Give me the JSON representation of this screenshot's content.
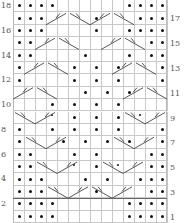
{
  "chart": {
    "cols": 14,
    "rows": 18,
    "legend_symbols": {
      "p": "purl (dot)",
      "s": "small dot",
      "": "knit (blank)",
      "R": "right cross cable",
      "L": "left cross cable"
    },
    "row_labels_left": [
      "18",
      "16",
      "14",
      "12",
      "10",
      "8",
      "6",
      "4",
      "2"
    ],
    "row_labels_right": [
      "17",
      "15",
      "13",
      "11",
      "9",
      "7",
      "5",
      "3",
      "1"
    ],
    "grid_top_to_bottom": [
      [
        "p",
        "p",
        "p",
        "p",
        "",
        "",
        "",
        "",
        "",
        "",
        "p",
        "p",
        "p",
        "p"
      ],
      [
        "p",
        "p",
        "p",
        "R",
        "R",
        "",
        "L",
        "p",
        "R",
        "",
        "L",
        "p",
        "p",
        "p"
      ],
      [
        "p",
        "p",
        "p",
        "",
        "",
        "",
        "",
        "p",
        "",
        "",
        "p",
        "p",
        "p",
        "p"
      ],
      [
        "p",
        "p",
        "R",
        "R",
        "",
        "L",
        "L",
        "",
        "",
        "R",
        "R",
        "",
        "p",
        "p"
      ],
      [
        "p",
        "p",
        "",
        "",
        "",
        "",
        "p",
        "",
        "",
        "",
        "p",
        "",
        "p",
        "p"
      ],
      [
        "p",
        "R",
        "R",
        "",
        "L",
        "p",
        "",
        "p",
        "",
        "p",
        "R",
        "",
        "L",
        "p"
      ],
      [
        "p",
        "",
        "",
        "L",
        "",
        "p",
        "",
        "p",
        "",
        "p",
        "",
        "R",
        "",
        "p"
      ],
      [
        "R",
        "",
        "L",
        "",
        "",
        "",
        "p",
        "",
        "p",
        "",
        "p",
        "",
        "",
        "L"
      ],
      [
        "",
        "",
        "",
        "p",
        "",
        "p",
        "",
        "p",
        "",
        "p",
        "",
        "",
        "",
        ""
      ],
      [
        "L",
        "",
        "R",
        "s",
        "",
        "p",
        "",
        "p",
        "",
        "p",
        "",
        "s",
        "",
        "R"
      ],
      [
        "p",
        "",
        "",
        "p",
        "",
        "p",
        "",
        "p",
        "",
        "p",
        "",
        "",
        "",
        "p"
      ],
      [
        "p",
        "L",
        "",
        "",
        "p",
        "",
        "p",
        "",
        "p",
        "",
        "p",
        "",
        "R",
        "p"
      ],
      [
        "p",
        "p",
        "",
        "",
        "",
        "p",
        "",
        "p",
        "",
        "",
        "",
        "",
        "p",
        "p"
      ],
      [
        "p",
        "p",
        "L",
        "",
        "",
        "s",
        "",
        "p",
        "",
        "s",
        "",
        "R",
        "p",
        "p"
      ],
      [
        "p",
        "p",
        "p",
        "",
        "",
        "",
        "p",
        "",
        "p",
        "",
        "",
        "p",
        "p",
        "p"
      ],
      [
        "p",
        "p",
        "p",
        "L",
        "",
        "",
        "L",
        "p",
        "R",
        "",
        "",
        "R",
        "p",
        "p"
      ],
      [
        "p",
        "p",
        "p",
        "p",
        "",
        "",
        "",
        "",
        "",
        "",
        "p",
        "p",
        "p",
        "p"
      ],
      [
        "p",
        "p",
        "p",
        "p",
        "",
        "",
        "",
        "",
        "",
        "",
        "p",
        "p",
        "p",
        "p"
      ]
    ],
    "cables": [
      {
        "row": 2,
        "c1": 4,
        "dir": "R"
      },
      {
        "row": 2,
        "c1": 6,
        "dir": "L"
      },
      {
        "row": 2,
        "c1": 8,
        "dir": "R"
      },
      {
        "row": 2,
        "c1": 10,
        "dir": "L"
      },
      {
        "row": 4,
        "c1": 3,
        "dir": "R"
      },
      {
        "row": 4,
        "c1": 5,
        "dir": "L"
      },
      {
        "row": 4,
        "c1": 9,
        "dir": "R"
      },
      {
        "row": 4,
        "c1": 11,
        "dir": "L"
      },
      {
        "row": 6,
        "c1": 2,
        "dir": "R"
      },
      {
        "row": 6,
        "c1": 4,
        "dir": "L"
      },
      {
        "row": 6,
        "c1": 10,
        "dir": "R"
      },
      {
        "row": 6,
        "c1": 12,
        "dir": "L"
      },
      {
        "row": 8,
        "c1": 1,
        "dir": "R"
      },
      {
        "row": 8,
        "c1": 3,
        "dir": "L"
      },
      {
        "row": 8,
        "c1": 11,
        "dir": "R"
      },
      {
        "row": 8,
        "c1": 13,
        "dir": "L"
      },
      {
        "row": 10,
        "c1": 1,
        "dir": "L"
      },
      {
        "row": 10,
        "c1": 3,
        "dir": "R"
      },
      {
        "row": 10,
        "c1": 11,
        "dir": "L"
      },
      {
        "row": 10,
        "c1": 13,
        "dir": "R"
      },
      {
        "row": 12,
        "c1": 2,
        "dir": "L"
      },
      {
        "row": 12,
        "c1": 4,
        "dir": "R"
      },
      {
        "row": 12,
        "c1": 10,
        "dir": "L"
      },
      {
        "row": 12,
        "c1": 12,
        "dir": "R"
      },
      {
        "row": 14,
        "c1": 3,
        "dir": "L"
      },
      {
        "row": 14,
        "c1": 5,
        "dir": "R"
      },
      {
        "row": 14,
        "c1": 9,
        "dir": "L"
      },
      {
        "row": 14,
        "c1": 11,
        "dir": "R"
      },
      {
        "row": 16,
        "c1": 4,
        "dir": "L"
      },
      {
        "row": 16,
        "c1": 6,
        "dir": "R"
      },
      {
        "row": 16,
        "c1": 8,
        "dir": "L"
      },
      {
        "row": 16,
        "c1": 10,
        "dir": "R"
      }
    ]
  }
}
